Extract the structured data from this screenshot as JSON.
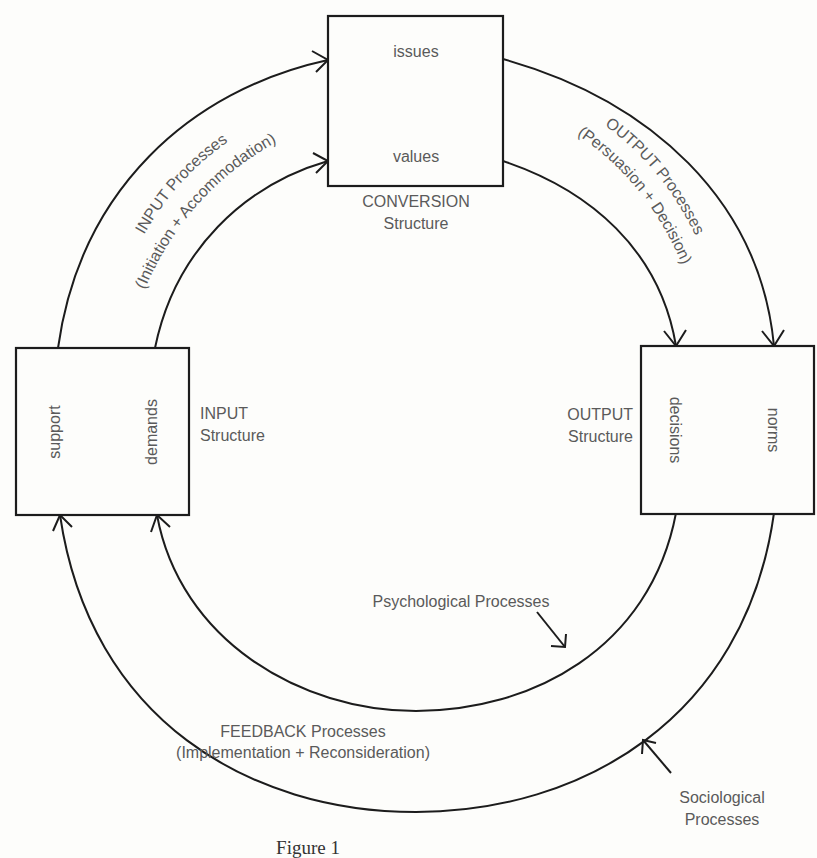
{
  "diagram": {
    "conversion_box": {
      "items": [
        "issues",
        "values"
      ],
      "label_line1": "CONVERSION",
      "label_line2": "Structure"
    },
    "input_box": {
      "items": [
        "support",
        "demands"
      ],
      "label_line1": "INPUT",
      "label_line2": "Structure"
    },
    "output_box": {
      "items": [
        "decisions",
        "norms"
      ],
      "label_line1": "OUTPUT",
      "label_line2": "Structure"
    },
    "input_processes": {
      "line1": "INPUT Processes",
      "line2": "(Initiation + Accommodation)"
    },
    "output_processes": {
      "line1": "OUTPUT Processes",
      "line2": "(Persuasion + Decision)"
    },
    "feedback_processes": {
      "line1": "FEEDBACK Processes",
      "line2": "(Implementation + Reconsideration)"
    },
    "psychological_processes": "Psychological Processes",
    "sociological_processes": {
      "line1": "Sociological",
      "line2": "Processes"
    },
    "caption": "Figure 1"
  }
}
